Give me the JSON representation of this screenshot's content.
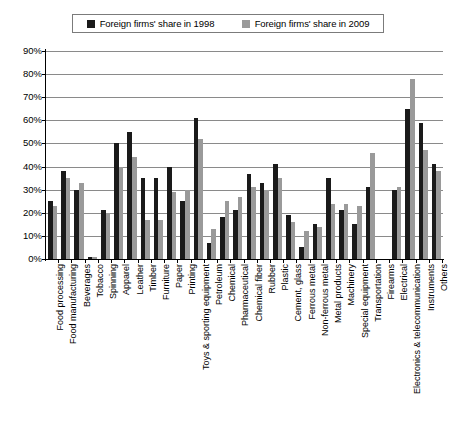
{
  "legend": {
    "entries": [
      {
        "label": "Foreign firms' share in 1998",
        "color": "#1a1a1a",
        "swatch_name": "legend-swatch-1998"
      },
      {
        "label": "Foreign firms' share in 2009",
        "color": "#9a9a9a",
        "swatch_name": "legend-swatch-2009"
      }
    ]
  },
  "yaxis": {
    "ticks": [
      "90%",
      "80%",
      "70%",
      "60%",
      "50%",
      "40%",
      "30%",
      "20%",
      "10%",
      "0%"
    ]
  },
  "chart_data": {
    "type": "bar",
    "title": "",
    "subtitle": "",
    "xlabel": "",
    "ylabel": "",
    "ylim": [
      0,
      90
    ],
    "ytick_values": [
      0,
      10,
      20,
      30,
      40,
      50,
      60,
      70,
      80,
      90
    ],
    "grid": true,
    "legend_position": "top-center",
    "categories": [
      "Food processing",
      "Food manufacturing",
      "Beverages",
      "Tobacco",
      "Spinning",
      "Apparel",
      "Leather",
      "Timber",
      "Furniture",
      "Paper",
      "Printing",
      "Toys & sporting equipment",
      "Petroleum",
      "Chemical",
      "Pharmaceutical",
      "Chemical fiber",
      "Rubber",
      "Plastic",
      "Cement, glass",
      "Ferrous metal",
      "Non-ferrous metal",
      "Metal products",
      "Machinery",
      "Special equipment",
      "Transportation",
      "Firearms",
      "Electrical",
      "Electronics & telecommunication",
      "Instruments",
      "Others"
    ],
    "series": [
      {
        "name": "Foreign firms' share in 1998",
        "color": "#1a1a1a",
        "values": [
          25,
          38,
          30,
          1,
          21,
          50,
          55,
          35,
          35,
          40,
          25,
          61,
          7,
          18,
          21,
          37,
          33,
          41,
          19,
          5,
          15,
          35,
          21,
          15,
          31,
          0,
          30,
          65,
          59,
          41
        ]
      },
      {
        "name": "Foreign firms' share in 2009",
        "color": "#9a9a9a",
        "values": [
          23,
          35,
          33,
          1,
          20,
          40,
          44,
          17,
          17,
          29,
          30,
          52,
          13,
          25,
          27,
          31,
          30,
          35,
          16,
          12,
          14,
          24,
          24,
          23,
          46,
          0,
          31,
          78,
          47,
          38
        ]
      }
    ]
  }
}
